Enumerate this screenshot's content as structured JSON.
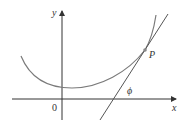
{
  "diagram": {
    "labels": {
      "y_axis": "y",
      "x_axis": "x",
      "origin": "0",
      "point": "P",
      "angle": "ϕ"
    },
    "colors": {
      "axis": "#333333",
      "curve": "#7a7a7a",
      "tangent": "#555555",
      "point": "#888888",
      "text": "#333333"
    }
  }
}
